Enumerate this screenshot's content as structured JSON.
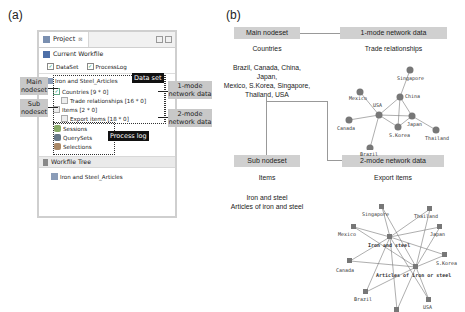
{
  "panel_a": {
    "label": "(a)",
    "window": {
      "tab_title": "Project",
      "tab_close": "⊠",
      "current_workfile": {
        "header": "Current Workfile",
        "checkboxes": [
          {
            "label": "DataSet",
            "checked": true
          },
          {
            "label": "ProcessLog",
            "checked": true
          }
        ]
      },
      "tree": {
        "root": "Iron and Steel_Articles",
        "countries": "Countries [9 * 0]",
        "trade": "Trade relationships [16 * 0]",
        "items": "Items [2 * 0]",
        "export": "Export items [18 * 0]",
        "sessions": "Sessions",
        "querysets": "QuerySets",
        "selections": "Selections"
      },
      "workfile_tree": {
        "header": "Workfile Tree",
        "item": "Iron and Steel_Articles"
      }
    },
    "callouts": {
      "main_nodeset_1": "Main",
      "main_nodeset_2": "nodeset",
      "sub_nodeset_1": "Sub",
      "sub_nodeset_2": "nodeset",
      "data_set": "Data set",
      "process_log": "Process log",
      "one_mode_1": "1-mode",
      "one_mode_2": "network data",
      "two_mode_1": "2-mode",
      "two_mode_2": "network data"
    }
  },
  "panel_b": {
    "label": "(b)",
    "main_nodeset": "Main nodeset",
    "one_mode": "1-mode network data",
    "countries_title": "Countries",
    "countries_list_1": "Brazil, Canada, China, Japan,",
    "countries_list_2": "Mexico, S.Korea, Singapore,",
    "countries_list_3": "Thailand, USA",
    "trade_title": "Trade relationships",
    "sub_nodeset": "Sub nodeset",
    "two_mode": "2-mode network data",
    "items_title": "Items",
    "items_1": "Iron and steel",
    "items_2": "Articles of iron and steel",
    "export_title": "Export items",
    "trade_nodes": [
      "Singapore",
      "Mexico",
      "China",
      "USA",
      "Canada",
      "Japan",
      "S.Korea",
      "Thailand",
      "Brazil"
    ],
    "export_nodes": [
      "Singapore",
      "Thailand",
      "Mexico",
      "Japan",
      "Iron and steel",
      "S.Korea",
      "Canada",
      "Articles of iron or steel",
      "Brazil",
      "USA",
      "China"
    ]
  }
}
